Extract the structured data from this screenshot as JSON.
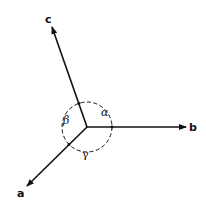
{
  "diagram": {
    "type": "crystal-axes",
    "axes": [
      {
        "name": "a",
        "label": "a"
      },
      {
        "name": "b",
        "label": "b"
      },
      {
        "name": "c",
        "label": "c"
      }
    ],
    "angles": [
      {
        "name": "alpha",
        "label": "α",
        "between": "b-c"
      },
      {
        "name": "beta",
        "label": "β",
        "between": "a-c"
      },
      {
        "name": "gamma",
        "label": "γ",
        "between": "a-b"
      }
    ],
    "colors": {
      "ink": "#111111",
      "background": "#ffffff"
    }
  }
}
